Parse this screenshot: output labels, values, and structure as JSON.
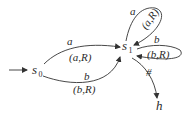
{
  "diagram": {
    "type": "state-transition-diagram",
    "states": [
      {
        "id": "s0",
        "name": "s",
        "subscript": "0",
        "initial": true
      },
      {
        "id": "s1",
        "name": "s",
        "subscript": "1"
      },
      {
        "id": "h",
        "name": "h",
        "halt": true
      }
    ],
    "transitions": [
      {
        "from": "s0",
        "to": "s1",
        "symbol": "a",
        "action": "(a,R)"
      },
      {
        "from": "s0",
        "to": "s1",
        "symbol": "b",
        "action": "(b,R)"
      },
      {
        "from": "s1",
        "to": "s1",
        "symbol": "a",
        "action": "(a,R)"
      },
      {
        "from": "s1",
        "to": "s1",
        "symbol": "b",
        "action": "(b,R)"
      },
      {
        "from": "s1",
        "to": "h",
        "symbol": "#",
        "action": ""
      }
    ]
  },
  "labels": {
    "s0_name": "s",
    "s0_sub": "0",
    "s1_name": "s",
    "s1_sub": "1",
    "h_name": "h",
    "e1_symbol": "a",
    "e1_action": "(a,R)",
    "e2_symbol": "b",
    "e2_action": "(b,R)",
    "loop_a_symbol": "a",
    "loop_a_action": "(a,R)",
    "loop_b_symbol": "b",
    "loop_b_action": "(b,R)",
    "halt_symbol": "#"
  }
}
